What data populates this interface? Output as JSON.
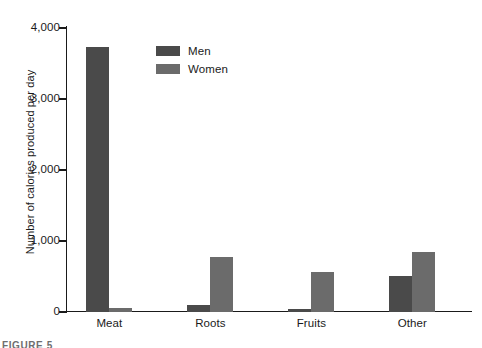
{
  "chart_data": {
    "type": "bar",
    "title": "",
    "subtitle": "",
    "xlabel": "",
    "ylabel": "Number of calories produced per day",
    "categories": [
      "Meat",
      "Roots",
      "Fruits",
      "Other"
    ],
    "series": [
      {
        "name": "Men",
        "color": "#4a4a4a",
        "values": [
          3730,
          100,
          40,
          510
        ]
      },
      {
        "name": "Women",
        "color": "#6b6b6b",
        "values": [
          60,
          780,
          570,
          845
        ]
      }
    ],
    "ylim": [
      0,
      4000
    ],
    "y_ticks": [
      0,
      1000,
      2000,
      3000,
      4000
    ],
    "y_tick_labels": [
      "0",
      "1,000",
      "2,000",
      "3,000",
      "4,000"
    ],
    "grid": false,
    "legend_position": "top-left-inside",
    "axis_color": "#1a1a1a"
  },
  "legend": {
    "entries": [
      {
        "label": "Men"
      },
      {
        "label": "Women"
      }
    ]
  },
  "caption": {
    "partial_text": "FIGURE 5"
  }
}
